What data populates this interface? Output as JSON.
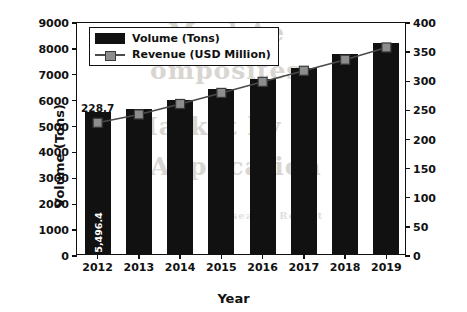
{
  "chart_data": {
    "type": "bar",
    "title": "",
    "subtitle": "",
    "xlabel": "Year",
    "ylabel": "Volume (Tons)",
    "y2label": "Revenue (USD Million)",
    "categories": [
      "2012",
      "2013",
      "2014",
      "2015",
      "2016",
      "2017",
      "2018",
      "2019"
    ],
    "ylim": [
      0,
      9000
    ],
    "y2lim": [
      0,
      400
    ],
    "yticks": [
      0,
      1000,
      2000,
      3000,
      4000,
      5000,
      6000,
      7000,
      8000,
      9000
    ],
    "y2ticks": [
      0,
      50,
      100,
      150,
      200,
      250,
      300,
      350,
      400
    ],
    "grid": false,
    "legend_position": "upper-left",
    "series": [
      {
        "name": "Volume (Tons)",
        "type": "bar",
        "axis": "left",
        "color": "#111111",
        "values": [
          5496.4,
          5620,
          5950,
          6370,
          6760,
          7180,
          7720,
          8150
        ]
      },
      {
        "name": "Revenue (USD Million)",
        "type": "line",
        "axis": "right",
        "color": "#4a4a4a",
        "marker_color": "#8d8d8d",
        "values": [
          228.7,
          243,
          261,
          280,
          299,
          318,
          337,
          358
        ]
      }
    ],
    "annotations": [
      {
        "text": "228.7",
        "series": "Revenue (USD Million)",
        "category": "2012",
        "placement": "above-point"
      },
      {
        "text": "5,496.4",
        "series": "Volume (Tons)",
        "category": "2012",
        "placement": "inside-bar-rotated"
      }
    ]
  },
  "legend": {
    "items": [
      {
        "label": "Volume (Tons)",
        "marker": "bar-swatch"
      },
      {
        "label": "Revenue (USD Million)",
        "marker": "line-square-swatch"
      }
    ]
  },
  "background_text": {
    "line1": "Merl Ae",
    "line2": "omposites",
    "line3": "Market by",
    "line4": "Application",
    "line5": "Research Report"
  }
}
